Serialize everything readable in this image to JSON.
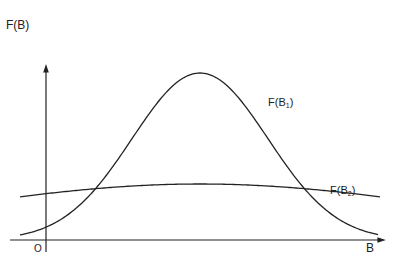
{
  "chart_data": {
    "type": "line",
    "title": "",
    "xlabel": "B",
    "ylabel": "F(B)",
    "origin_label": "O",
    "grid": false,
    "series": [
      {
        "name": "F(B1)",
        "label_main": "F(B",
        "label_sub": "1",
        "label_close": ")",
        "shape": "gaussian",
        "center_px": 200,
        "peak_px": 73,
        "sigma_px": 68
      },
      {
        "name": "F(B2)",
        "label_main": "F(B",
        "label_sub": "2",
        "label_close": ")",
        "shape": "gaussian",
        "center_px": 200,
        "peak_px": 184,
        "sigma_px": 250
      }
    ],
    "axes": {
      "origin_px": [
        46,
        240
      ],
      "x_end_px": 380,
      "y_top_px": 68
    },
    "line_color": "#222222"
  }
}
